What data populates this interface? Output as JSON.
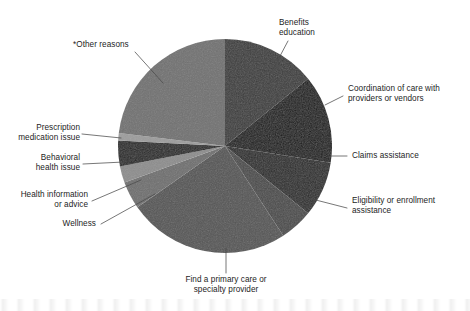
{
  "chart_data": {
    "type": "pie",
    "title": "",
    "subtitle": "",
    "xlabel": "",
    "ylabel": "",
    "legend_position": "none",
    "grid": false,
    "note": "Slice shares estimated from rendered sweep angles; chart shows no printed numeric values.",
    "center": {
      "x": 225,
      "y": 146,
      "radius": 107
    },
    "start_angle_deg": 0,
    "direction": "clockwise",
    "categories": [
      "Benefits education",
      "Coordination of care with providers or vendors",
      "Claims assistance",
      "Eligibility or enrollment assistance",
      "Find a primary care or specialty provider",
      "Wellness",
      "Health information or advice",
      "Behavioral health issue",
      "Prescription medication issue",
      "*Other reasons"
    ],
    "values": [
      14.2,
      13.3,
      8.3,
      5.0,
      24.4,
      4.2,
      2.5,
      3.9,
      1.1,
      23.1
    ],
    "angles_deg": [
      51,
      48,
      30,
      18,
      88,
      15,
      9,
      14,
      4,
      83
    ],
    "colors": [
      "#3c3c3c",
      "#191919",
      "#2b2b2b",
      "#4b4b4b",
      "#555555",
      "#6f6f6f",
      "#8d8d8d",
      "#272727",
      "#9c9c9c",
      "#717171"
    ],
    "slices": [
      {
        "label": "Benefits education",
        "angle_deg": 51,
        "percent": 14.2,
        "color": "#3c3c3c"
      },
      {
        "label": "Coordination of care with providers or vendors",
        "angle_deg": 48,
        "percent": 13.3,
        "color": "#191919"
      },
      {
        "label": "Claims assistance",
        "angle_deg": 30,
        "percent": 8.3,
        "color": "#2b2b2b"
      },
      {
        "label": "Eligibility or enrollment assistance",
        "angle_deg": 18,
        "percent": 5.0,
        "color": "#4b4b4b"
      },
      {
        "label": "Find a primary care or specialty provider",
        "angle_deg": 88,
        "percent": 24.4,
        "color": "#555555"
      },
      {
        "label": "Wellness",
        "angle_deg": 15,
        "percent": 4.2,
        "color": "#6f6f6f"
      },
      {
        "label": "Health information or advice",
        "angle_deg": 9,
        "percent": 2.5,
        "color": "#8d8d8d"
      },
      {
        "label": "Behavioral health issue",
        "angle_deg": 14,
        "percent": 3.9,
        "color": "#272727"
      },
      {
        "label": "Prescription medication issue",
        "angle_deg": 4,
        "percent": 1.1,
        "color": "#9c9c9c"
      },
      {
        "label": "*Other reasons",
        "angle_deg": 83,
        "percent": 23.1,
        "color": "#717171"
      }
    ]
  },
  "labels": {
    "benefits_education": "Benefits\neducation",
    "coordination_of_care": "Coordination of care with\nproviders or vendors",
    "claims_assistance": "Claims assistance",
    "eligibility_or_enrollment": "Eligibility or enrollment\nassistance",
    "find_provider": "Find a primary care or\nspecialty provider",
    "wellness": "Wellness",
    "health_information": "Health information\nor advice",
    "behavioral_health": "Behavioral\nhealth issue",
    "prescription_medication": "Prescription\nmedication issue",
    "other_reasons": "*Other reasons"
  },
  "style": {
    "background": "#ffffff",
    "text_color": "#1d1d1d",
    "leader_line_color": "#4a4a4a"
  }
}
